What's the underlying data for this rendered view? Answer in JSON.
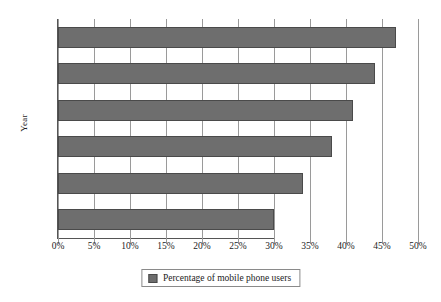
{
  "chart_data": {
    "type": "bar",
    "orientation": "horizontal",
    "title": "",
    "xlabel": "",
    "ylabel": "Year",
    "categories": [
      "2014",
      "2015",
      "*2016",
      "*2017",
      "*2018",
      "*2019"
    ],
    "values": [
      30,
      34,
      38,
      41,
      44,
      47
    ],
    "series": [
      {
        "name": "Percentage of mobile phone users",
        "values": [
          30,
          34,
          38,
          41,
          44,
          47
        ]
      }
    ],
    "xlim": [
      0,
      50
    ],
    "xticks": [
      0,
      5,
      10,
      15,
      20,
      25,
      30,
      35,
      40,
      45,
      50
    ],
    "xtick_labels": [
      "0%",
      "5%",
      "10%",
      "15%",
      "20%",
      "25%",
      "30%",
      "35%",
      "40%",
      "45%",
      "50%"
    ],
    "grid": "vertical",
    "legend_position": "bottom-center",
    "legend_entries": [
      "Percentage of mobile phone users"
    ],
    "bar_color": "#6e6e6e",
    "bar_edge_color": "#4a4a4a",
    "gridline_color": "#9a9a9a",
    "axis_color": "#555555",
    "note": "* denotes projected years"
  },
  "legend": {
    "label": "Percentage of mobile phone users"
  }
}
